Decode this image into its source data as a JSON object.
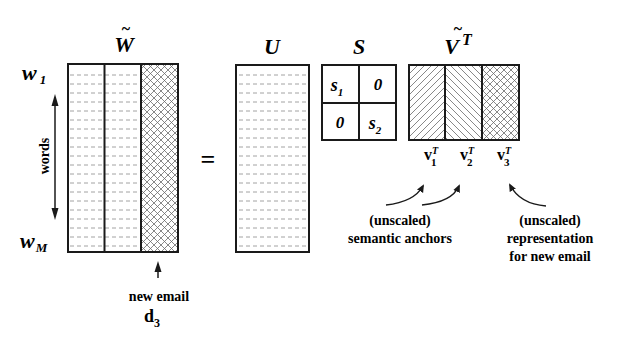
{
  "diagram": {
    "equals_sign": "=",
    "matrices": {
      "w_tilde": {
        "label": "W",
        "tilde": "~",
        "columns": [
          "document-1",
          "document-2",
          "new-email"
        ],
        "row_top_label_base": "w",
        "row_top_label_sub": "1",
        "row_bottom_label_base": "w",
        "row_bottom_label_sub": "M"
      },
      "u": {
        "label": "U"
      },
      "s": {
        "label": "S",
        "cells": [
          {
            "base": "s",
            "sub": "1"
          },
          {
            "base": "0",
            "sub": ""
          },
          {
            "base": "0",
            "sub": ""
          },
          {
            "base": "s",
            "sub": "2"
          }
        ]
      },
      "v_tilde_t": {
        "label": "V",
        "tilde": "~",
        "superscript": "T",
        "columns": [
          {
            "base": "v",
            "sup": "T",
            "sub": "1"
          },
          {
            "base": "v",
            "sup": "T",
            "sub": "2"
          },
          {
            "base": "v",
            "sup": "T",
            "sub": "3"
          }
        ]
      }
    },
    "axis": {
      "label": "words"
    },
    "annotations": {
      "new_email": {
        "line1": "new email",
        "doc_base": "d",
        "doc_sub": "3"
      },
      "semantic_anchors": {
        "line1": "(unscaled)",
        "line2": "semantic anchors"
      },
      "representation": {
        "line1": "(unscaled)",
        "line2": "representation",
        "line3": "for new email"
      }
    },
    "colors": {
      "stroke": "#1a1a1a",
      "dashed": "#8a8a8a",
      "hatch": "#6a6a6a",
      "background": "#ffffff"
    }
  }
}
